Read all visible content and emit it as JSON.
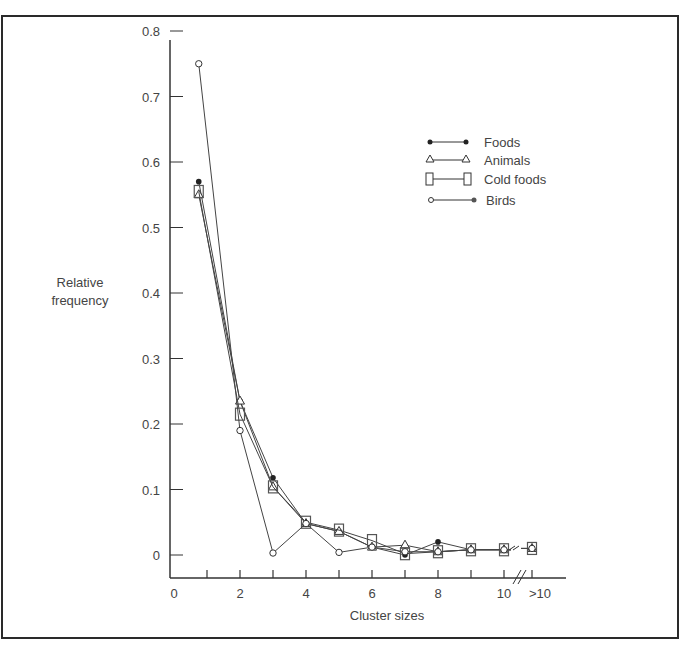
{
  "chart_data": {
    "type": "line",
    "title": "",
    "xlabel": "Cluster sizes",
    "ylabel": "Relative frequency",
    "ylabel_lines": [
      "Relative",
      "frequency"
    ],
    "x": [
      "1",
      "2",
      "3",
      "4",
      "5",
      "6",
      "7",
      "8",
      "9",
      "10",
      ">10"
    ],
    "x_positions": [
      0.75,
      2,
      3,
      4,
      5,
      6,
      7,
      8,
      9,
      10,
      11
    ],
    "x_tick_labels": [
      "0",
      "2",
      "4",
      "6",
      "8",
      "10",
      ">10"
    ],
    "x_tick_label_positions": [
      0,
      2,
      4,
      6,
      8,
      10,
      11.2
    ],
    "x_minor_ticks": [
      1,
      2,
      3,
      4,
      5,
      6,
      7,
      8,
      9,
      10,
      11
    ],
    "y_tick_labels": [
      "0",
      "0.1",
      "0.2",
      "0.3",
      "0.4",
      "0.5",
      "0.6",
      "0.7",
      "0.8"
    ],
    "y_ticks": [
      0,
      0.1,
      0.2,
      0.3,
      0.4,
      0.5,
      0.6,
      0.7,
      0.8
    ],
    "ylim": [
      -0.035,
      0.8
    ],
    "xlim": [
      0,
      12
    ],
    "axis_break": "between 10 and >10",
    "grid": false,
    "legend_position": "upper right",
    "series": [
      {
        "name": "Foods",
        "marker": "filled-circle",
        "values": [
          0.57,
          0.235,
          0.118,
          0.048,
          0.036,
          0.012,
          0.0,
          0.02,
          0.008,
          0.008,
          0.01
        ]
      },
      {
        "name": "Animals",
        "marker": "triangle",
        "values": [
          0.55,
          0.235,
          0.104,
          0.048,
          0.036,
          0.012,
          0.015,
          0.005,
          0.008,
          0.008,
          0.01
        ]
      },
      {
        "name": "Cold foods",
        "marker": "square",
        "values": [
          0.555,
          0.215,
          0.104,
          0.05,
          0.038,
          0.022,
          0.002,
          0.005,
          0.008,
          0.008,
          0.01
        ]
      },
      {
        "name": "Birds",
        "marker": "open-circle",
        "values": [
          0.75,
          0.19,
          0.003,
          0.048,
          0.004,
          0.012,
          0.005,
          0.005,
          0.008,
          0.008,
          0.01
        ]
      }
    ]
  },
  "legend": {
    "items": [
      {
        "label": "Foods"
      },
      {
        "label": "Animals"
      },
      {
        "label": "Cold foods"
      },
      {
        "label": "Birds"
      }
    ]
  },
  "axes": {
    "x_title": "Cluster sizes",
    "y_title_line1": "Relative",
    "y_title_line2": "frequency",
    "y_labels": [
      "0",
      "0.1",
      "0.2",
      "0.3",
      "0.4",
      "0.5",
      "0.6",
      "0.7",
      "0.8"
    ],
    "x_labels": [
      "0",
      "2",
      "4",
      "6",
      "8",
      "10",
      ">10"
    ]
  }
}
